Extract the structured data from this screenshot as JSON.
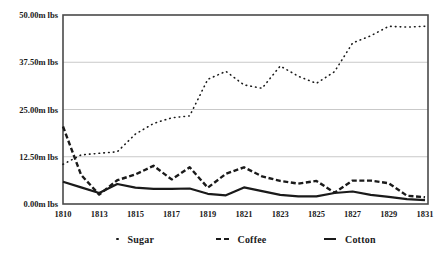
{
  "colors": {
    "line": "#1a1a1a",
    "plot_border": "#4a4a4a",
    "gridline": "#c9c9c9",
    "background": "#ffffff",
    "label_text": "#1a1a1a"
  },
  "chart_data": {
    "type": "line",
    "title": "",
    "xlabel": "",
    "ylabel": "",
    "unit": "m lbs",
    "grid": "horizontal",
    "legend_position": "bottom",
    "ylim": [
      0,
      50
    ],
    "yticks": [
      {
        "value": 0,
        "label": "0.00m lbs"
      },
      {
        "value": 12.5,
        "label": "12.50m lbs"
      },
      {
        "value": 25,
        "label": "25.00m lbs"
      },
      {
        "value": 37.5,
        "label": "37.50m lbs"
      },
      {
        "value": 50,
        "label": "50.00m lbs"
      }
    ],
    "categories": [
      "1810",
      "1812",
      "1813",
      "1814",
      "1815",
      "1816",
      "1817",
      "1818",
      "1819",
      "1820",
      "1821",
      "1822",
      "1823",
      "1824",
      "1825",
      "1826",
      "1827",
      "1828",
      "1829",
      "1830",
      "1831"
    ],
    "xticks": [
      {
        "i": 0,
        "label": "1810"
      },
      {
        "i": 2,
        "label": "1813"
      },
      {
        "i": 4,
        "label": "1815"
      },
      {
        "i": 6,
        "label": "1817"
      },
      {
        "i": 8,
        "label": "1819"
      },
      {
        "i": 10,
        "label": "1821"
      },
      {
        "i": 12,
        "label": "1823"
      },
      {
        "i": 14,
        "label": "1825"
      },
      {
        "i": 16,
        "label": "1827"
      },
      {
        "i": 18,
        "label": "1829"
      },
      {
        "i": 20,
        "label": "1831"
      }
    ],
    "series": [
      {
        "name": "Sugar",
        "style": "dotted",
        "values": [
          10.5,
          13.0,
          13.4,
          13.8,
          18.5,
          21.3,
          22.8,
          23.3,
          33.0,
          35.1,
          31.5,
          30.6,
          36.5,
          33.8,
          31.9,
          35.0,
          42.6,
          44.5,
          47.0,
          46.8,
          47.0
        ]
      },
      {
        "name": "Coffee",
        "style": "dashed",
        "values": [
          20.5,
          7.7,
          2.5,
          6.3,
          7.8,
          10.1,
          6.5,
          9.7,
          4.3,
          8.0,
          9.7,
          7.3,
          6.1,
          5.4,
          6.1,
          3.0,
          6.2,
          6.2,
          5.5,
          2.2,
          1.8
        ]
      },
      {
        "name": "Cotton",
        "style": "solid",
        "values": [
          5.9,
          4.4,
          2.9,
          5.3,
          4.3,
          4.0,
          4.0,
          4.1,
          2.7,
          2.3,
          4.4,
          3.4,
          2.4,
          2.0,
          2.0,
          2.9,
          3.3,
          2.4,
          1.9,
          1.3,
          1.0
        ]
      }
    ]
  },
  "legend": {
    "items": [
      {
        "label": "Sugar",
        "marker": "dot-marker",
        "left": 116
      },
      {
        "label": "Coffee",
        "marker": "dash-marker",
        "left": 216
      },
      {
        "label": "Cotton",
        "marker": "solid-marker",
        "left": 324
      }
    ]
  }
}
